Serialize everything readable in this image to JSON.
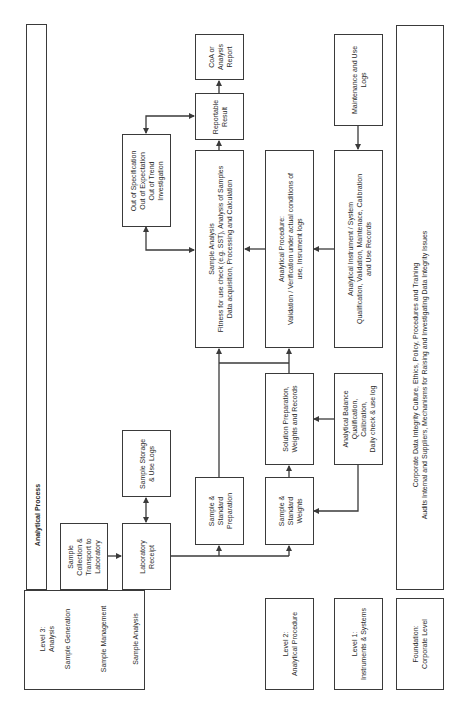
{
  "title": "Analytical Process",
  "levels": {
    "level3": {
      "title_line1": "Level 3:",
      "title_line2": "Analysis",
      "sub1": "Sample Generation",
      "sub2": "Sample Management",
      "sub3": "Sample Analysis"
    },
    "level2": {
      "line1": "Level 2:",
      "line2": "Analytical Procedure"
    },
    "level1": {
      "line1": "Level 1:",
      "line2": "Instruments & Systems"
    },
    "foundation": {
      "line1": "Foundation:",
      "line2": "Corporate Level"
    }
  },
  "boxes": {
    "sample_collection": [
      "Sample",
      "Collection &",
      "Transport to",
      "Laboratory"
    ],
    "laboratory_receipt": [
      "Laboratory",
      "Receipt"
    ],
    "sample_storage": [
      "Sample Storage",
      "& Use Logs"
    ],
    "sample_std_prep": [
      "Sample &",
      "Standard",
      "Preparation"
    ],
    "sample_std_weights": [
      "Sample &",
      "Standard",
      "Weights"
    ],
    "solution_prep": [
      "Solution Preparation,",
      "Weights and Records"
    ],
    "analytical_balance": [
      "Analytical Balance",
      "Qualification,",
      "Calibration,",
      "Daily check & use log"
    ],
    "sample_analysis": [
      "Sample Analysis",
      "Fitness for use check (e.g. SST), Analysis of Samples",
      "Data acquisition, Processing and Calculation"
    ],
    "analytical_procedure": [
      "Analytical Procedure:",
      "Validation / Verification under actual conditions of",
      "use, Insrument logs"
    ],
    "analytical_instrument": [
      "Analytical Instrument / System",
      "Qualification, Validation, Maintenace, Calibration",
      "and Use Records"
    ],
    "maintenance_logs": [
      "Maintenance and Use",
      "Logs"
    ],
    "oos": [
      "Out of Specification",
      "Out of Expectation",
      "Out of Trend",
      "Investigation"
    ],
    "reportable_result": [
      "Reportable",
      "Result"
    ],
    "coa": [
      "CoA or",
      "Analysis",
      "Report"
    ],
    "corporate": [
      "Corporate Data Integrity Culture, Ethics, Policy, Procedures and Training",
      "Audits Internal and Suppliers, Mechanisms for Raising and Investigating Data Integrity Issues"
    ]
  },
  "colors": {
    "line": "#3a3a3a",
    "background": "#ffffff",
    "text": "#2a2a2a"
  }
}
